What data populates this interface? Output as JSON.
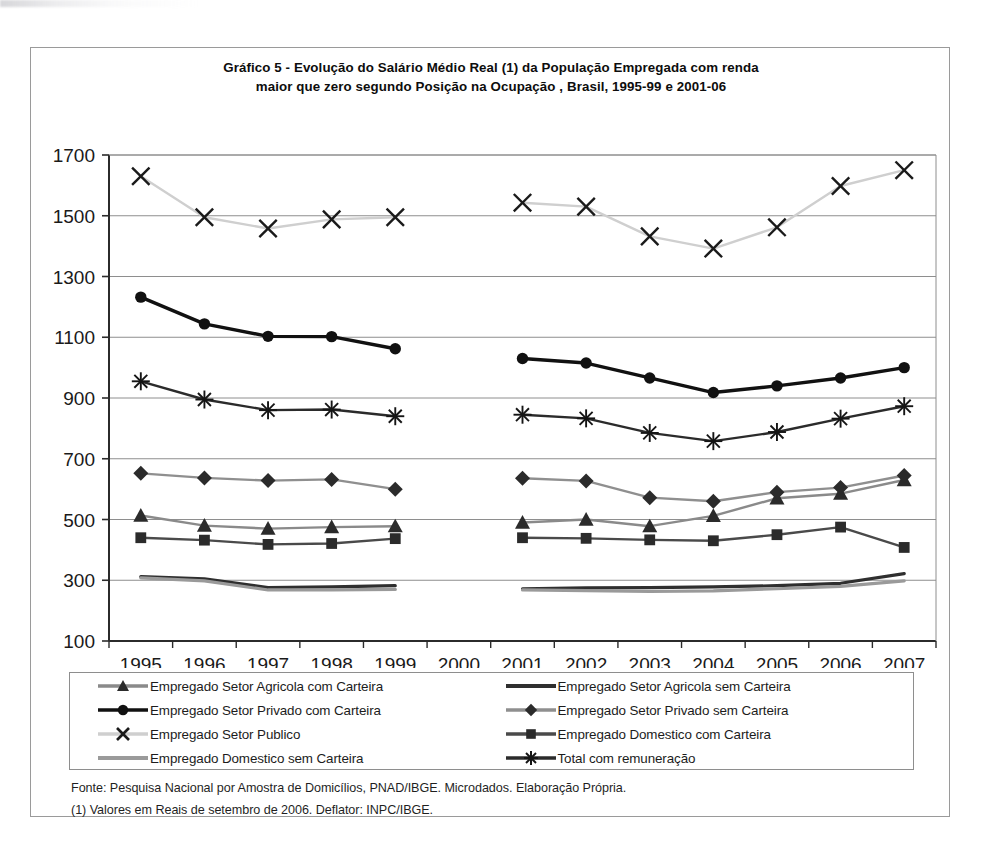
{
  "chart_data": {
    "type": "line",
    "title": "Gráfico 5 - Evolução do Salário Médio Real (1) da População Empregada com renda maior que zero segundo Posição na Ocupação , Brasil, 1995-99 e 2001-06",
    "title_line1": "Gráfico 5 - Evolução do Salário Médio Real (1) da População Empregada com renda",
    "title_line2": "maior que zero segundo Posição na Ocupação , Brasil, 1995-99 e 2001-06",
    "xlabel": "",
    "ylabel": "",
    "ylim": [
      100,
      1700
    ],
    "ytick_step": 200,
    "yticks": [
      100,
      300,
      500,
      700,
      900,
      1100,
      1300,
      1500,
      1700
    ],
    "categories": [
      "1995",
      "1996",
      "1997",
      "1998",
      "1999",
      "2000",
      "2001",
      "2002",
      "2003",
      "2004",
      "2005",
      "2006",
      "2007"
    ],
    "grid": "horizontal",
    "legend_position": "bottom",
    "note_missing_year": "2000",
    "series": [
      {
        "name": "Empregado Setor Agricola com Carteira",
        "marker": "triangle",
        "color": "#8a8a8a",
        "marker_color": "#2b2b2b",
        "values": [
          513,
          480,
          470,
          475,
          478,
          null,
          490,
          500,
          478,
          512,
          570,
          585,
          630
        ]
      },
      {
        "name": "Empregado Setor Agricola sem Carteira",
        "marker": "none",
        "color": "#2f2f2f",
        "marker_color": "#2f2f2f",
        "values": [
          312,
          305,
          276,
          278,
          282,
          null,
          272,
          275,
          276,
          278,
          282,
          290,
          322
        ]
      },
      {
        "name": "Empregado Setor Privado com Carteira",
        "marker": "circle",
        "color": "#111111",
        "marker_color": "#111111",
        "values": [
          1232,
          1144,
          1103,
          1102,
          1062,
          null,
          1030,
          1015,
          966,
          918,
          940,
          966,
          1000
        ]
      },
      {
        "name": "Empregado Setor Privado sem Carteira",
        "marker": "diamond",
        "color": "#8f8f8f",
        "marker_color": "#2b2b2b",
        "values": [
          652,
          637,
          628,
          632,
          600,
          null,
          636,
          627,
          572,
          560,
          590,
          605,
          645
        ]
      },
      {
        "name": "Empregado Setor Publico",
        "marker": "x",
        "color": "#cfcfcf",
        "marker_color": "#1a1a1a",
        "values": [
          1630,
          1495,
          1458,
          1488,
          1495,
          null,
          1543,
          1530,
          1432,
          1392,
          1462,
          1598,
          1650
        ]
      },
      {
        "name": "Empregado Domestico com Carteira",
        "marker": "square",
        "color": "#4a4a4a",
        "marker_color": "#2b2b2b",
        "values": [
          440,
          432,
          418,
          421,
          437,
          null,
          440,
          438,
          433,
          430,
          450,
          475,
          408
        ]
      },
      {
        "name": "Empregado Domestico sem Carteira",
        "marker": "none",
        "color": "#9a9a9a",
        "marker_color": "#9a9a9a",
        "values": [
          308,
          298,
          268,
          268,
          270,
          null,
          268,
          266,
          263,
          265,
          272,
          280,
          298
        ]
      },
      {
        "name": "Total com remuneração",
        "marker": "asterisk",
        "color": "#2b2b2b",
        "marker_color": "#151515",
        "values": [
          955,
          895,
          860,
          862,
          840,
          null,
          845,
          833,
          785,
          758,
          788,
          832,
          873
        ]
      }
    ]
  },
  "legend": {
    "items": [
      {
        "label": "Empregado Setor Agricola com Carteira",
        "marker": "triangle",
        "line_color": "#8a8a8a",
        "marker_color": "#2b2b2b"
      },
      {
        "label": "Empregado Setor Agricola sem Carteira",
        "marker": "none",
        "line_color": "#2f2f2f",
        "marker_color": "#2f2f2f"
      },
      {
        "label": "Empregado Setor Privado com Carteira",
        "marker": "circle",
        "line_color": "#111111",
        "marker_color": "#111111"
      },
      {
        "label": "Empregado Setor Privado sem Carteira",
        "marker": "diamond",
        "line_color": "#8f8f8f",
        "marker_color": "#2b2b2b"
      },
      {
        "label": "Empregado Setor Publico",
        "marker": "x",
        "line_color": "#cfcfcf",
        "marker_color": "#1a1a1a"
      },
      {
        "label": "Empregado Domestico com Carteira",
        "marker": "square",
        "line_color": "#4a4a4a",
        "marker_color": "#2b2b2b"
      },
      {
        "label": "Empregado Domestico sem Carteira",
        "marker": "none",
        "line_color": "#9a9a9a",
        "marker_color": "#9a9a9a"
      },
      {
        "label": "Total com remuneração",
        "marker": "asterisk",
        "line_color": "#2b2b2b",
        "marker_color": "#151515"
      }
    ]
  },
  "footnotes": [
    "Fonte: Pesquisa Nacional por Amostra de Domicílios, PNAD/IBGE. Microdados. Elaboração Própria.",
    "(1) Valores em Reais de setembro de 2006. Deflator: INPC/IBGE."
  ],
  "colors": {
    "frame": "#9a9a9a",
    "grid": "#8e8e8e",
    "axis": "#2b2b2b",
    "text": "#1a1a1a",
    "background": "#ffffff"
  }
}
